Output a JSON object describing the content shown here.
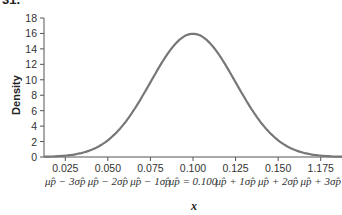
{
  "figure_number": "31.",
  "chart_data": {
    "type": "line",
    "title": "",
    "xlabel": "x",
    "ylabel": "Density",
    "ylim": [
      0,
      18
    ],
    "xlim": [
      0.0125,
      0.1875
    ],
    "grid": false,
    "y_ticks": [
      0,
      2,
      4,
      6,
      8,
      10,
      12,
      14,
      16,
      18
    ],
    "x_ticks": [
      {
        "value": 0.025,
        "label": "0.025",
        "sigma_label": "μp̂ − 3σp̂"
      },
      {
        "value": 0.05,
        "label": "0.050",
        "sigma_label": "μp̂ − 2σp̂"
      },
      {
        "value": 0.075,
        "label": "0.075",
        "sigma_label": "μp̂ − 1σp̂"
      },
      {
        "value": 0.1,
        "label": "0.100",
        "sigma_label": "μp̂ = 0.100"
      },
      {
        "value": 0.125,
        "label": "0.125",
        "sigma_label": "μp̂ + 1σp̂"
      },
      {
        "value": 0.15,
        "label": "0.150",
        "sigma_label": "μp̂ + 2σp̂"
      },
      {
        "value": 0.175,
        "label": "1.175",
        "sigma_label": "μp̂ + 3σp̂"
      }
    ],
    "series": [
      {
        "name": "Normal density",
        "mean": 0.1,
        "sd": 0.025,
        "peak_density": 15.96,
        "color": "#777777"
      }
    ]
  }
}
